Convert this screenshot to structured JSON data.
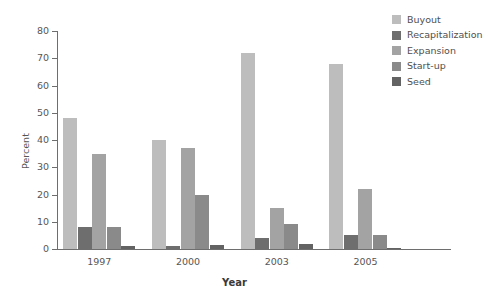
{
  "chart_data": {
    "type": "bar",
    "title": "",
    "subtitle": "",
    "xlabel": "Year",
    "ylabel": "Percent",
    "categories": [
      "1997",
      "2000",
      "2003",
      "2005"
    ],
    "ylim": [
      0,
      80
    ],
    "yticks": [
      0,
      10,
      20,
      30,
      40,
      50,
      60,
      70,
      80
    ],
    "ytick_labels": [
      "0",
      "10",
      "20",
      "30",
      "40",
      "50",
      "60",
      "70",
      "80"
    ],
    "grid": false,
    "legend_position": "top-right",
    "series": [
      {
        "name": "Buyout",
        "color": "#bdbdbd",
        "values": [
          48,
          40,
          72,
          68
        ]
      },
      {
        "name": "Recapitalization",
        "color": "#6e6e6e",
        "values": [
          8,
          1,
          4,
          5
        ]
      },
      {
        "name": "Expansion",
        "color": "#a3a3a3",
        "values": [
          35,
          37,
          15,
          22
        ]
      },
      {
        "name": "Start-up",
        "color": "#8a8a8a",
        "values": [
          8,
          20,
          9,
          5
        ]
      },
      {
        "name": "Seed",
        "color": "#636363",
        "values": [
          1,
          1.5,
          2,
          0.5
        ]
      }
    ]
  },
  "colors": {
    "background": "#ffffff",
    "axis": "#6e6e6e",
    "tick_text": "#565656",
    "axis_label_text": "#3a3a3a",
    "legend_text": "#4f4f4f"
  }
}
